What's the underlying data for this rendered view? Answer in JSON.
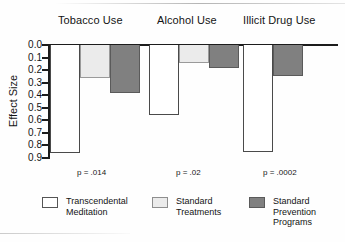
{
  "chart_data": {
    "type": "bar",
    "title": "",
    "xlabel": "",
    "ylabel": "Effect Size",
    "ylim": [
      0.0,
      0.9
    ],
    "y_inverted": true,
    "grid": false,
    "legend_position": "bottom",
    "categories": [
      "Tobacco Use",
      "Alcohol Use",
      "Illicit Drug Use"
    ],
    "tick_labels": [
      "0.0",
      "0.1",
      "0.2",
      "0.3",
      "0.4",
      "0.5",
      "0.6",
      "0.7",
      "0.8",
      "0.9"
    ],
    "tick_values": [
      0.0,
      0.1,
      0.2,
      0.3,
      0.4,
      0.5,
      0.6,
      0.7,
      0.8,
      0.9
    ],
    "series": [
      {
        "name": "Transcendental Meditation",
        "color": "#ffffff",
        "values": [
          0.86,
          0.56,
          0.85
        ]
      },
      {
        "name": "Standard Treatments",
        "color": "#ebebeb",
        "values": [
          0.26,
          0.14,
          null
        ]
      },
      {
        "name": "Standard Prevention Programs",
        "color": "#808080",
        "values": [
          0.38,
          0.18,
          0.25
        ]
      }
    ],
    "annotations": [
      {
        "category": "Tobacco Use",
        "text": "p = .014"
      },
      {
        "category": "Alcohol Use",
        "text": "p = .02"
      },
      {
        "category": "Illicit Drug Use",
        "text": "p = .0002"
      }
    ]
  },
  "axis": {
    "y_title": "Effect Size",
    "ticks": [
      {
        "label": "0.0"
      },
      {
        "label": "0.1"
      },
      {
        "label": "0.2"
      },
      {
        "label": "0.3"
      },
      {
        "label": "0.4"
      },
      {
        "label": "0.5"
      },
      {
        "label": "0.6"
      },
      {
        "label": "0.7"
      },
      {
        "label": "0.8"
      },
      {
        "label": "0.9"
      }
    ]
  },
  "groups": [
    {
      "title": "Tobacco Use",
      "p_text": "p = .014"
    },
    {
      "title": "Alcohol Use",
      "p_text": "p = .02"
    },
    {
      "title": "Illicit Drug Use",
      "p_text": "p = .0002"
    }
  ],
  "legend": {
    "items": [
      {
        "label": "Transcendental\nMeditation",
        "swatch": "white"
      },
      {
        "label": "Standard\nTreatments",
        "swatch": "light-gray"
      },
      {
        "label": "Standard\nPrevention\nPrograms",
        "swatch": "dark-gray"
      }
    ]
  },
  "colors": {
    "bar_white": "#ffffff",
    "bar_light_gray": "#ebebeb",
    "bar_dark_gray": "#808080",
    "axis": "#1c1c1c"
  }
}
